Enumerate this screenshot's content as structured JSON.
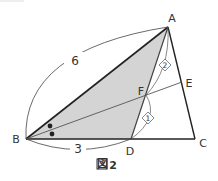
{
  "figure": {
    "caption": "図 2",
    "caption_kanji": "図",
    "caption_number": "2"
  },
  "points": {
    "A": {
      "label": "A",
      "x": 168,
      "y": 27
    },
    "B": {
      "label": "B",
      "x": 26,
      "y": 139
    },
    "C": {
      "label": "C",
      "x": 195,
      "y": 139
    },
    "D": {
      "label": "D",
      "x": 131,
      "y": 139
    },
    "E": {
      "label": "E",
      "x": 182,
      "y": 82
    },
    "F": {
      "label": "F",
      "x": 146,
      "y": 95
    }
  },
  "segments": {
    "AB": {
      "label": "6"
    },
    "BD": {
      "label": "3"
    },
    "AF": {
      "ratio": "2"
    },
    "FD": {
      "ratio": "1"
    }
  },
  "angle_marks": {
    "description": "Angle ABE and angle EBC marked equal (dots)",
    "count": 2
  },
  "shaded_region": "triangle ABD",
  "colors": {
    "shade": "#d4d4d4",
    "line": "#222222",
    "thin_line": "#555555",
    "text": "#333333"
  }
}
